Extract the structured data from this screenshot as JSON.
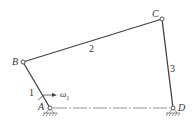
{
  "diagram": {
    "joints": {
      "A": {
        "label": "A",
        "x": 50,
        "y": 108
      },
      "B": {
        "label": "B",
        "x": 23,
        "y": 62
      },
      "C": {
        "label": "C",
        "x": 162,
        "y": 19
      },
      "D": {
        "label": "D",
        "x": 173,
        "y": 108
      }
    },
    "links": [
      {
        "label": "1",
        "from": "A",
        "to": "B"
      },
      {
        "label": "2",
        "from": "B",
        "to": "C"
      },
      {
        "label": "3",
        "from": "C",
        "to": "D"
      }
    ],
    "angular_velocity": {
      "symbol": "ω",
      "subscript": "1"
    },
    "colors": {
      "line": "#444444",
      "ground": "#666666"
    }
  }
}
